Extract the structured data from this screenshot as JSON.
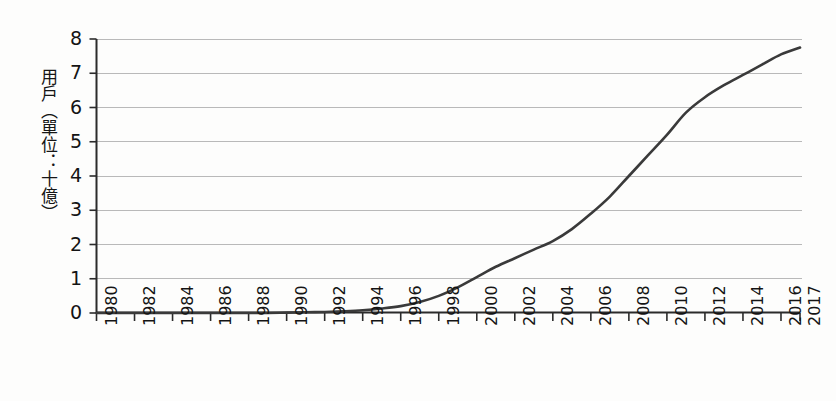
{
  "chart_data": {
    "type": "line",
    "title": "",
    "subtitle": "",
    "xlabel": "",
    "ylabel": "用戶（單位：十億）",
    "ylabel_parts": [
      "用戶",
      "（單位：十億）"
    ],
    "xlim": [
      1980,
      2017
    ],
    "ylim": [
      0,
      8
    ],
    "grid": true,
    "grid_axis": "y",
    "legend": false,
    "legend_position": "none",
    "y_ticks": [
      0,
      1,
      2,
      3,
      4,
      5,
      6,
      7,
      8
    ],
    "y_tick_labels": [
      "0",
      "1",
      "2",
      "3",
      "4",
      "5",
      "6",
      "7",
      "8"
    ],
    "x_ticks": [
      1980,
      1982,
      1984,
      1986,
      1988,
      1990,
      1992,
      1994,
      1996,
      1998,
      2000,
      2002,
      2004,
      2006,
      2008,
      2010,
      2012,
      2014,
      2016,
      2017
    ],
    "x_tick_labels": [
      "1980",
      "1982",
      "1984",
      "1986",
      "1988",
      "1990",
      "1992",
      "1994",
      "1996",
      "1998",
      "2000",
      "2002",
      "2004",
      "2006",
      "2008",
      "2010",
      "2012",
      "2014",
      "2016",
      "2017"
    ],
    "series": [
      {
        "name": "用戶",
        "color": "#3a3a3a",
        "line_width": 2.6,
        "x": [
          1980,
          1981,
          1982,
          1983,
          1984,
          1985,
          1986,
          1987,
          1988,
          1989,
          1990,
          1991,
          1992,
          1993,
          1994,
          1995,
          1996,
          1997,
          1998,
          1999,
          2000,
          2001,
          2002,
          2003,
          2004,
          2005,
          2006,
          2007,
          2008,
          2009,
          2010,
          2011,
          2012,
          2013,
          2014,
          2015,
          2016,
          2017
        ],
        "values": [
          0.0,
          0.0,
          0.0,
          0.0,
          0.0,
          0.0,
          0.0,
          0.0,
          0.0,
          0.0,
          0.01,
          0.02,
          0.03,
          0.05,
          0.08,
          0.13,
          0.2,
          0.32,
          0.5,
          0.75,
          1.05,
          1.35,
          1.6,
          1.85,
          2.1,
          2.45,
          2.9,
          3.4,
          4.0,
          4.6,
          5.2,
          5.85,
          6.3,
          6.65,
          6.95,
          7.25,
          7.55,
          7.75
        ]
      }
    ]
  }
}
